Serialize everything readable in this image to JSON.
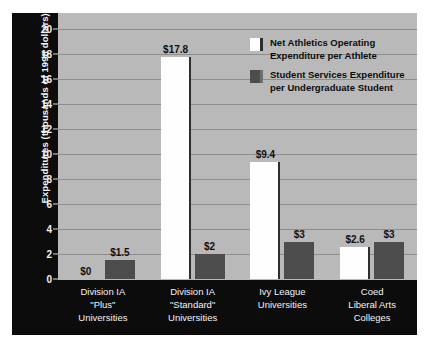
{
  "chart_data": {
    "type": "bar",
    "title": "",
    "xlabel": "",
    "ylabel": "Expenditures (thousands of 1998 dollars)",
    "ylim": [
      0,
      20
    ],
    "yticks": [
      0,
      2,
      4,
      6,
      8,
      10,
      12,
      14,
      16,
      18,
      20
    ],
    "grid": true,
    "legend_position": "inside-top-right",
    "categories": [
      "Division IA \"Plus\" Universities",
      "Division IA \"Standard\" Universities",
      "Ivy League Universities",
      "Coed Liberal Arts Colleges"
    ],
    "category_lines": [
      [
        "Division IA",
        "\"Plus\"",
        "Universities"
      ],
      [
        "Division IA",
        "\"Standard\"",
        "Universities"
      ],
      [
        "Ivy League",
        "Universities"
      ],
      [
        "Coed",
        "Liberal Arts",
        "Colleges"
      ]
    ],
    "series": [
      {
        "name": "Net Athletics Operating Expenditure per Athlete",
        "color": "#ffffff",
        "values": [
          0,
          17.8,
          9.4,
          2.6
        ],
        "labels": [
          "$0",
          "$17.8",
          "$9.4",
          "$2.6"
        ]
      },
      {
        "name": "Student Services Expenditure per Undergraduate Student",
        "color": "#4d4d4d",
        "values": [
          1.5,
          2,
          3,
          3
        ],
        "labels": [
          "$1.5",
          "$2",
          "$3",
          "$3"
        ]
      }
    ]
  },
  "legend": {
    "entries": [
      {
        "line1": "Net Athletics Operating",
        "line2": "Expenditure per Athlete",
        "swatch": "white"
      },
      {
        "line1": "Student Services Expenditure",
        "line2": "per Undergraduate Student",
        "swatch": "gray"
      }
    ]
  },
  "colors": {
    "panel": "#0c0c0c",
    "plot_background": "#b9b9b9",
    "gridline": "#8d8d8d",
    "bar_white": "#fefefe",
    "bar_gray": "#4d4d4d",
    "tick_text": "#f2f2f2",
    "label_text": "#101010"
  }
}
